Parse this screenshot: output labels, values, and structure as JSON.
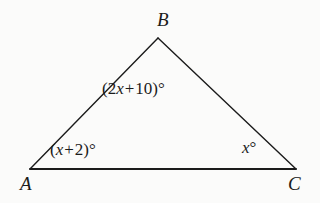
{
  "figure": {
    "type": "triangle-diagram",
    "background_color": "#fbfbfa",
    "stroke_color": "#1b1b1b",
    "vertices": {
      "A": {
        "label": "A",
        "x": 30,
        "y": 169
      },
      "B": {
        "label": "B",
        "x": 158,
        "y": 38
      },
      "C": {
        "label": "C",
        "x": 296,
        "y": 169
      }
    },
    "sides": [
      {
        "name": "AB",
        "from": "A",
        "to": "B"
      },
      {
        "name": "BC",
        "from": "B",
        "to": "C"
      },
      {
        "name": "AC",
        "from": "A",
        "to": "C"
      }
    ],
    "angles": {
      "at_A": {
        "expression": "(x + 2)°",
        "open": "(",
        "variable": "x",
        "operator": "+",
        "constant": "2",
        "close": ")°"
      },
      "at_B": {
        "expression": "(2x + 10)°",
        "open": "(",
        "coefficient": "2",
        "variable": "x",
        "operator": "+",
        "constant": "10",
        "close": ")°"
      },
      "at_C": {
        "expression": "x°",
        "variable": "x",
        "degree": "°"
      }
    }
  }
}
